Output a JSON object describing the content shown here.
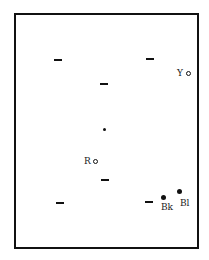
{
  "diagram": {
    "title": "",
    "markers": {
      "dashes": [
        {
          "x": 54,
          "y": 59
        },
        {
          "x": 146,
          "y": 58
        },
        {
          "x": 100,
          "y": 83
        },
        {
          "x": 101,
          "y": 179
        },
        {
          "x": 56,
          "y": 202
        },
        {
          "x": 145,
          "y": 201
        }
      ],
      "small_dot": {
        "x": 104,
        "y": 129
      }
    },
    "points": [
      {
        "id": "Y",
        "label": "Y",
        "marker": "open-circle",
        "x": 187,
        "y": 72
      },
      {
        "id": "R",
        "label": "R",
        "marker": "open-circle",
        "x": 94,
        "y": 160
      },
      {
        "id": "Bk",
        "label": "Bk",
        "marker": "filled-circle",
        "x": 163,
        "y": 198
      },
      {
        "id": "Bl",
        "label": "Bl",
        "marker": "filled-circle",
        "x": 180,
        "y": 191
      }
    ]
  }
}
